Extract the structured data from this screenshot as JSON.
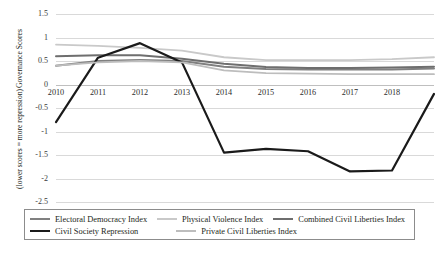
{
  "chart_data": {
    "type": "line",
    "title": "",
    "xlabel": "",
    "ylabel": "Governance Scores",
    "ylabel_line2": "(lower scores = more repression)",
    "x": [
      2010,
      2011,
      2012,
      2013,
      2014,
      2015,
      2016,
      2017,
      2018,
      2019
    ],
    "xtick_labels": [
      "2010",
      "2011",
      "2012",
      "2013",
      "2014",
      "2015",
      "2016",
      "2017",
      "2018"
    ],
    "ytick_labels": [
      "1.5",
      "1",
      "0.5",
      "0",
      "-0.5",
      "-1",
      "-1.5",
      "-2",
      "-2.5"
    ],
    "ytick_values": [
      1.5,
      1,
      0.5,
      0,
      -0.5,
      -1,
      -1.5,
      -2,
      -2.5
    ],
    "ylim": [
      -2.5,
      1.5
    ],
    "xlim": [
      2010,
      2019
    ],
    "grid": true,
    "legend_position": "bottom",
    "series": [
      {
        "name": "Electoral Democracy Index",
        "color": "#808080",
        "width": 2.0,
        "values": [
          0.4,
          0.5,
          0.52,
          0.5,
          0.38,
          0.33,
          0.32,
          0.32,
          0.32,
          0.34
        ]
      },
      {
        "name": "Physical Violence Index",
        "color": "#c9c9c9",
        "width": 1.8,
        "values": [
          0.85,
          0.82,
          0.78,
          0.72,
          0.58,
          0.52,
          0.52,
          0.52,
          0.54,
          0.58
        ]
      },
      {
        "name": "Combined Civil Liberties Index",
        "color": "#6e6e6e",
        "width": 2.0,
        "values": [
          0.6,
          0.62,
          0.62,
          0.55,
          0.44,
          0.37,
          0.35,
          0.35,
          0.36,
          0.38
        ]
      },
      {
        "name": "Civil Society Repression",
        "color": "#1a1a1a",
        "width": 2.2,
        "values": [
          -0.8,
          0.57,
          0.88,
          0.47,
          -1.45,
          -1.37,
          -1.42,
          -1.85,
          -1.83,
          -0.2
        ]
      },
      {
        "name": "Private Civil Liberties Index",
        "color": "#bdbdbd",
        "width": 1.8,
        "values": [
          0.4,
          0.47,
          0.5,
          0.47,
          0.3,
          0.24,
          0.23,
          0.22,
          0.22,
          0.22
        ]
      }
    ]
  },
  "legend": {
    "row1": [
      {
        "label": "Electoral Democracy Index",
        "color": "#808080"
      },
      {
        "label": "Physical Violence Index",
        "color": "#c9c9c9"
      },
      {
        "label": "Combined Civil Liberties Index",
        "color": "#6e6e6e"
      }
    ],
    "row2": [
      {
        "label": "Civil Society Repression",
        "color": "#1a1a1a"
      },
      {
        "label": "Private Civil Liberties Index",
        "color": "#bdbdbd"
      }
    ]
  }
}
